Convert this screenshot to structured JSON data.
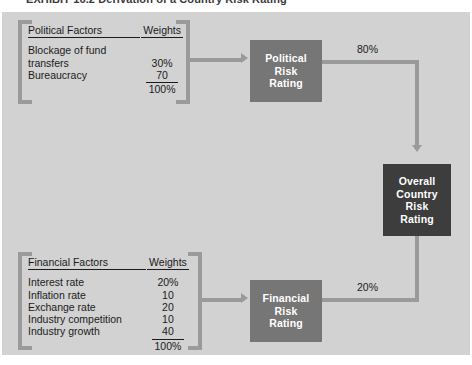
{
  "caption": {
    "text": "EXHIBIT 16.2   Derivation of a Country Risk Rating"
  },
  "political_group": {
    "header": {
      "factors": "Political Factors",
      "weights": "Weights"
    },
    "rows": [
      {
        "label": "Blockage of fund",
        "label2": "transfers",
        "weight": "30%",
        "ruled": false
      },
      {
        "label": "Bureaucracy",
        "weight": "70",
        "ruled": true
      }
    ],
    "total": "100%"
  },
  "financial_group": {
    "header": {
      "factors": "Financial Factors",
      "weights": "Weights"
    },
    "rows": [
      {
        "label": "Interest rate",
        "weight": "20%",
        "ruled": false
      },
      {
        "label": "Inflation rate",
        "weight": "10",
        "ruled": false
      },
      {
        "label": "Exchange rate",
        "weight": "20",
        "ruled": false
      },
      {
        "label": "Industry competition",
        "weight": "10",
        "ruled": false
      },
      {
        "label": "Industry growth",
        "weight": "40",
        "ruled": true
      }
    ],
    "total": "100%"
  },
  "boxes": {
    "political": {
      "line1": "Political",
      "line2": "Risk",
      "line3": "Rating"
    },
    "financial": {
      "line1": "Financial",
      "line2": "Risk",
      "line3": "Rating"
    },
    "overall": {
      "line1": "Overall",
      "line2": "Country",
      "line3": "Risk",
      "line4": "Rating"
    }
  },
  "weights_on_lines": {
    "political_to_overall": "80%",
    "financial_to_overall": "20%"
  },
  "colors": {
    "panel_background": "#d2d2d2",
    "connector": "#9a9a9a",
    "sub_box": "#767676",
    "overall_box": "#3d3d3d",
    "text": "#1b1b1b",
    "box_text": "#ffffff"
  }
}
